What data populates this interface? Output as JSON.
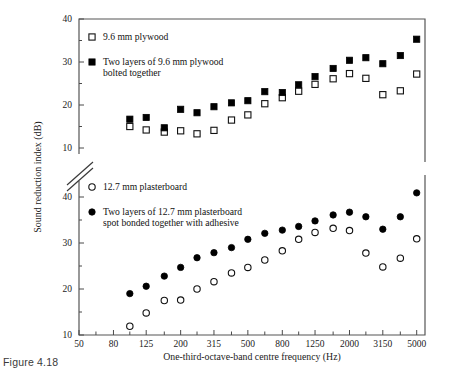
{
  "figure": {
    "caption": "Figure 4.18"
  },
  "chart_data": {
    "type": "scatter",
    "title": "",
    "xlabel": "One-third-octave-band centre frequency (Hz)",
    "ylabel": "Sound reduction index (dB)",
    "xscale": "log",
    "xlim": [
      50,
      5600
    ],
    "xticklabels": [
      "50",
      "80",
      "125",
      "200",
      "315",
      "500",
      "800",
      "1250",
      "2000",
      "3150",
      "5000"
    ],
    "xtickvalues": [
      50,
      80,
      125,
      200,
      315,
      500,
      800,
      1250,
      2000,
      3150,
      5000
    ],
    "grid": false,
    "broken_axis": true,
    "panels": [
      {
        "name": "upper-panel",
        "ylim": [
          10,
          40
        ],
        "yticklabels": [
          "10",
          "20",
          "30",
          "40"
        ],
        "ytickvalues": [
          10,
          20,
          30,
          40
        ],
        "x": [
          100,
          125,
          160,
          200,
          250,
          315,
          400,
          500,
          630,
          800,
          1000,
          1250,
          1600,
          2000,
          2500,
          3150,
          4000,
          5000
        ],
        "series": [
          {
            "name": "9.6 mm plywood",
            "marker": "open-square",
            "values": [
              15.0,
              14.2,
              13.7,
              14.0,
              13.3,
              14.1,
              16.5,
              17.7,
              20.3,
              21.7,
              23.2,
              24.8,
              26.1,
              27.3,
              26.2,
              22.4,
              23.3,
              27.2
            ]
          },
          {
            "name": "Two layers of 9.6 mm plywood bolted together",
            "marker": "filled-square",
            "values": [
              16.7,
              17.1,
              14.7,
              19.0,
              18.2,
              19.6,
              20.5,
              21.0,
              23.1,
              22.9,
              24.7,
              26.6,
              28.5,
              30.4,
              31.0,
              29.6,
              31.5,
              35.3
            ]
          }
        ]
      },
      {
        "name": "lower-panel",
        "ylim": [
          10,
          40
        ],
        "yticklabels": [
          "10",
          "20",
          "30",
          "40"
        ],
        "ytickvalues": [
          10,
          20,
          30,
          40
        ],
        "x": [
          100,
          125,
          160,
          200,
          250,
          315,
          400,
          500,
          630,
          800,
          1000,
          1250,
          1600,
          2000,
          2500,
          3150,
          4000,
          5000
        ],
        "series": [
          {
            "name": "12.7 mm plasterboard",
            "marker": "open-circle",
            "values": [
              11.9,
              14.8,
              17.5,
              17.6,
              20.0,
              21.6,
              23.5,
              24.7,
              26.3,
              28.3,
              30.8,
              32.3,
              33.2,
              32.7,
              27.8,
              24.8,
              26.7,
              30.9
            ]
          },
          {
            "name": "Two layers of 12.7 mm plasterboard spot bonded together with adhesive",
            "marker": "filled-circle",
            "values": [
              19.0,
              20.6,
              22.8,
              24.7,
              26.8,
              27.9,
              29.0,
              30.8,
              32.1,
              32.8,
              33.6,
              34.8,
              36.1,
              36.7,
              35.7,
              33.0,
              35.7,
              40.9
            ]
          }
        ]
      }
    ],
    "legend": {
      "position": "inside-upper-left",
      "entries": [
        {
          "marker": "open-square",
          "label_line1": "9.6 mm plywood",
          "label_line2": ""
        },
        {
          "marker": "filled-square",
          "label_line1": "Two layers of 9.6 mm plywood",
          "label_line2": "bolted together"
        },
        {
          "marker": "open-circle",
          "label_line1": "12.7 mm plasterboard",
          "label_line2": ""
        },
        {
          "marker": "filled-circle",
          "label_line1": "Two layers of 12.7 mm plasterboard",
          "label_line2": "spot bonded together with adhesive"
        }
      ]
    },
    "colors": {
      "marker_fill": "#000000",
      "marker_open": "#ffffff",
      "axis": "#4a4a4a",
      "text": "#1a1a1a",
      "background": "#ffffff"
    }
  }
}
